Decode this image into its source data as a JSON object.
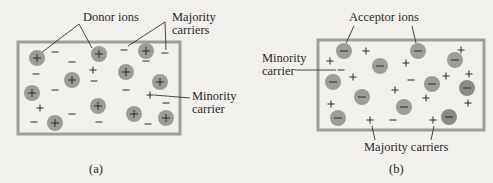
{
  "panels": [
    {
      "id": "a",
      "caption": "(a)",
      "type": "n-type semiconductor",
      "labels": {
        "ions": "Donor ions",
        "majority": "Majority carriers",
        "majority_line1": "Majority",
        "majority_line2": "carriers",
        "minority_line1": "Minority",
        "minority_line2": "carrier"
      },
      "ion_sign": "+",
      "ions": [
        [
          37,
          58
        ],
        [
          99,
          54
        ],
        [
          146,
          51
        ],
        [
          72,
          80
        ],
        [
          126,
          72
        ],
        [
          32,
          93
        ],
        [
          98,
          106
        ],
        [
          160,
          82
        ],
        [
          134,
          114
        ],
        [
          55,
          123
        ],
        [
          166,
          118
        ]
      ],
      "minus": [
        [
          55,
          52
        ],
        [
          72,
          62
        ],
        [
          36,
          74
        ],
        [
          55,
          90
        ],
        [
          72,
          114
        ],
        [
          34,
          122
        ],
        [
          124,
          50
        ],
        [
          165,
          53
        ],
        [
          94,
          81
        ],
        [
          146,
          61
        ],
        [
          126,
          90
        ],
        [
          99,
          122
        ],
        [
          166,
          103
        ],
        [
          148,
          124
        ]
      ],
      "plus": [
        [
          93,
          70
        ],
        [
          40,
          108
        ],
        [
          150,
          95
        ]
      ]
    },
    {
      "id": "b",
      "caption": "(b)",
      "type": "p-type semiconductor",
      "labels": {
        "ions": "Acceptor ions",
        "majority": "Majority carriers",
        "minority_line1": "Minority",
        "minority_line2": "carrier"
      },
      "ion_sign": "−",
      "ions": [
        [
          344,
          51
        ],
        [
          380,
          66
        ],
        [
          418,
          51
        ],
        [
          455,
          60
        ],
        [
          333,
          82
        ],
        [
          362,
          97
        ],
        [
          432,
          84
        ],
        [
          467,
          88
        ],
        [
          404,
          107
        ],
        [
          338,
          118
        ],
        [
          449,
          117
        ]
      ],
      "plus": [
        [
          366,
          51
        ],
        [
          330,
          61
        ],
        [
          353,
          77
        ],
        [
          406,
          63
        ],
        [
          461,
          50
        ],
        [
          446,
          76
        ],
        [
          469,
          74
        ],
        [
          395,
          90
        ],
        [
          426,
          98
        ],
        [
          331,
          104
        ],
        [
          468,
          103
        ],
        [
          370,
          120
        ],
        [
          433,
          120
        ]
      ],
      "minus": [
        [
          341,
          70
        ],
        [
          411,
          80
        ],
        [
          393,
          120
        ]
      ]
    }
  ],
  "colors": {
    "background": "#f1f0ec",
    "box_border": "#9e9e9c",
    "ion_fill": "#9c9c9a",
    "ion_fill_dark": "#8a8a88",
    "text": "#2a2a2a"
  }
}
